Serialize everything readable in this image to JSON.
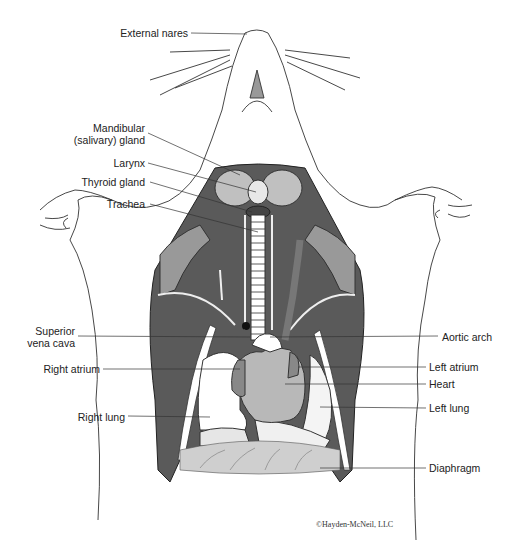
{
  "figure": {
    "labels_left": [
      {
        "id": "external-nares",
        "text": "External nares"
      },
      {
        "id": "mandibular-gland",
        "text": "Mandibular",
        "text2": "(salivary) gland"
      },
      {
        "id": "larynx",
        "text": "Larynx"
      },
      {
        "id": "thyroid-gland",
        "text": "Thyroid gland"
      },
      {
        "id": "trachea",
        "text": "Trachea"
      },
      {
        "id": "superior-vena-cava",
        "text": "Superior",
        "text2": "vena cava"
      },
      {
        "id": "right-atrium",
        "text": "Right atrium"
      },
      {
        "id": "right-lung",
        "text": "Right lung"
      }
    ],
    "labels_right": [
      {
        "id": "aortic-arch",
        "text": "Aortic arch"
      },
      {
        "id": "left-atrium",
        "text": "Left atrium"
      },
      {
        "id": "heart",
        "text": "Heart"
      },
      {
        "id": "left-lung",
        "text": "Left lung"
      },
      {
        "id": "diaphragm",
        "text": "Diaphragm"
      }
    ],
    "copyright": "©Hayden-McNeil, LLC"
  },
  "colors": {
    "outline": "#333333",
    "dark_tissue": "#555555",
    "mid_tissue": "#8a8a8a",
    "light_tissue": "#bdbdbd",
    "gland": "#b0b0b0",
    "background": "#ffffff"
  }
}
